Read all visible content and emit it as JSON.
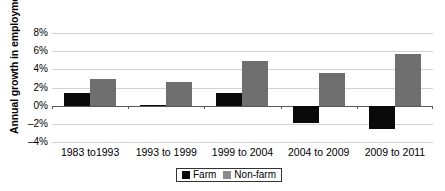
{
  "chart_data": {
    "type": "bar",
    "title": "",
    "subtitle": "",
    "xlabel": "",
    "ylabel": "Annual growth in employment",
    "categories": [
      "1983 to1993",
      "1993 to 1999",
      "1999 to 2004",
      "2004 to 2009",
      "2009 to 2011"
    ],
    "series": [
      {
        "name": "Farm",
        "color": "#0a0a0a",
        "values": [
          1.4,
          0.05,
          1.4,
          -1.9,
          -2.6
        ]
      },
      {
        "name": "Non-farm",
        "color": "#6f6f6f",
        "values": [
          2.9,
          2.6,
          4.9,
          3.6,
          5.7
        ]
      }
    ],
    "ylim": [
      -4,
      8
    ],
    "ytick_labels": [
      "8%",
      "6%",
      "4%",
      "2%",
      "0%",
      "–2%",
      "–4%"
    ],
    "ytick_values": [
      8,
      6,
      4,
      2,
      0,
      -2,
      -4
    ],
    "grid": true,
    "legend_position": "bottom-center",
    "value_suffix": "%"
  },
  "legend": {
    "entries": [
      {
        "label": "Farm",
        "swatch": "farm-swatch"
      },
      {
        "label": "Non-farm",
        "swatch": "non-farm-swatch"
      }
    ]
  }
}
